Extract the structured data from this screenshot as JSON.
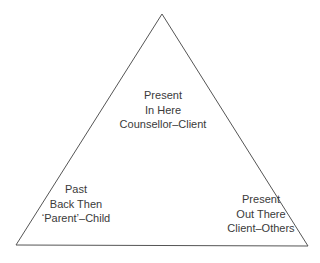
{
  "diagram": {
    "type": "triangle",
    "stroke_color": "#555555",
    "vertices": {
      "apex": [
        162,
        14
      ],
      "bottom_left": [
        16,
        245
      ],
      "bottom_right": [
        308,
        246
      ]
    },
    "corners": {
      "apex": {
        "lines": [
          "Present",
          "In Here",
          "Counsellor–Client"
        ]
      },
      "bottom_left": {
        "lines": [
          "Past",
          "Back Then",
          "‘Parent’–Child"
        ]
      },
      "bottom_right": {
        "lines": [
          "Present",
          "Out There",
          "Client–Others"
        ]
      }
    }
  }
}
